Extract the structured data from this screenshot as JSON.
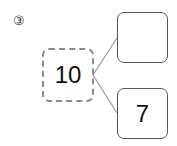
{
  "problem": {
    "label": "③",
    "whole": "10",
    "parts": [
      {
        "value": ""
      },
      {
        "value": "7"
      }
    ]
  },
  "colors": {
    "dashed_border": "#8a8a8a",
    "box_border": "#555555",
    "line": "#999999",
    "text": "#111111"
  }
}
